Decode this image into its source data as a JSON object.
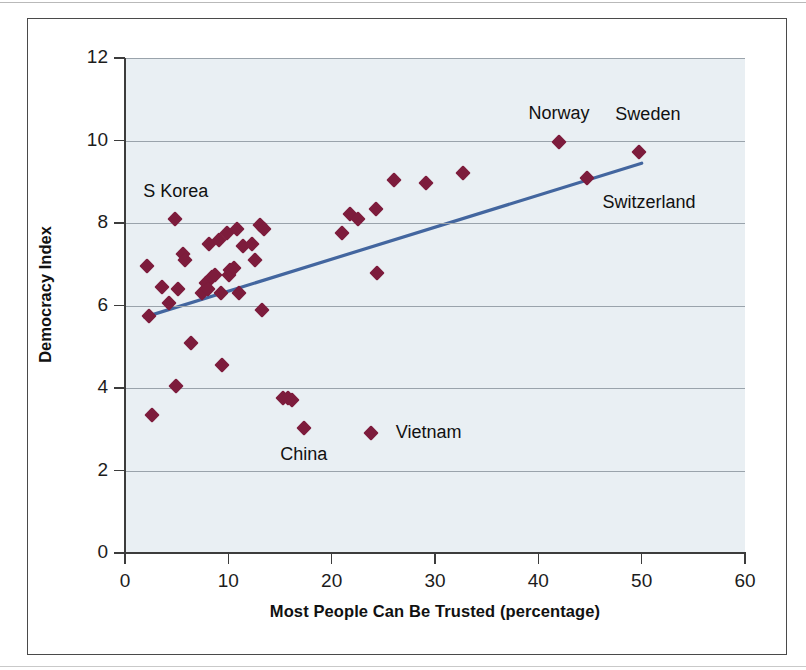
{
  "figure": {
    "background_color": "#ffffff",
    "frame_color": "#4a4a4a",
    "plot_background_color": "#e9eff3",
    "gridline_color": "#9aa3ab",
    "marker_color": "#7d1c3c",
    "trendline_color": "#43669f"
  },
  "chart_data": {
    "type": "scatter",
    "title": "",
    "xlabel": "Most People Can Be Trusted (percentage)",
    "ylabel": "Democracy Index",
    "xlim": [
      0,
      60
    ],
    "ylim": [
      0,
      12
    ],
    "xticks": [
      0,
      10,
      20,
      30,
      40,
      50,
      60
    ],
    "yticks": [
      0,
      2,
      4,
      6,
      8,
      10,
      12
    ],
    "xtick_labels": [
      "0",
      "10",
      "20",
      "30",
      "40",
      "50",
      "60"
    ],
    "ytick_labels": [
      "0",
      "2",
      "4",
      "6",
      "8",
      "10",
      "12"
    ],
    "grid": "horizontal",
    "legend": "none",
    "points": [
      {
        "x": 2.1,
        "y": 6.95,
        "label": ""
      },
      {
        "x": 2.3,
        "y": 5.75,
        "label": ""
      },
      {
        "x": 2.6,
        "y": 3.35,
        "label": ""
      },
      {
        "x": 3.6,
        "y": 6.45,
        "label": ""
      },
      {
        "x": 4.3,
        "y": 6.05,
        "label": ""
      },
      {
        "x": 4.8,
        "y": 8.1,
        "label": "S Korea"
      },
      {
        "x": 4.9,
        "y": 4.05,
        "label": ""
      },
      {
        "x": 5.1,
        "y": 6.4,
        "label": ""
      },
      {
        "x": 5.6,
        "y": 7.25,
        "label": ""
      },
      {
        "x": 5.8,
        "y": 7.1,
        "label": ""
      },
      {
        "x": 6.4,
        "y": 5.1,
        "label": ""
      },
      {
        "x": 7.4,
        "y": 6.3,
        "label": ""
      },
      {
        "x": 7.8,
        "y": 6.55,
        "label": ""
      },
      {
        "x": 8.0,
        "y": 6.4,
        "label": ""
      },
      {
        "x": 8.1,
        "y": 7.5,
        "label": ""
      },
      {
        "x": 8.4,
        "y": 6.7,
        "label": ""
      },
      {
        "x": 8.7,
        "y": 6.75,
        "label": ""
      },
      {
        "x": 9.1,
        "y": 7.6,
        "label": ""
      },
      {
        "x": 9.3,
        "y": 6.3,
        "label": ""
      },
      {
        "x": 9.4,
        "y": 4.55,
        "label": ""
      },
      {
        "x": 9.9,
        "y": 7.75,
        "label": ""
      },
      {
        "x": 10.1,
        "y": 6.75,
        "label": ""
      },
      {
        "x": 10.2,
        "y": 6.85,
        "label": ""
      },
      {
        "x": 10.5,
        "y": 6.9,
        "label": ""
      },
      {
        "x": 10.8,
        "y": 7.85,
        "label": ""
      },
      {
        "x": 11.0,
        "y": 6.3,
        "label": ""
      },
      {
        "x": 11.4,
        "y": 7.45,
        "label": ""
      },
      {
        "x": 12.3,
        "y": 7.5,
        "label": ""
      },
      {
        "x": 12.6,
        "y": 7.1,
        "label": ""
      },
      {
        "x": 13.1,
        "y": 7.95,
        "label": ""
      },
      {
        "x": 13.4,
        "y": 7.85,
        "label": ""
      },
      {
        "x": 13.3,
        "y": 5.9,
        "label": ""
      },
      {
        "x": 15.3,
        "y": 3.75,
        "label": ""
      },
      {
        "x": 15.8,
        "y": 3.75,
        "label": ""
      },
      {
        "x": 16.2,
        "y": 3.72,
        "label": ""
      },
      {
        "x": 17.3,
        "y": 3.03,
        "label": "China"
      },
      {
        "x": 21.0,
        "y": 7.75,
        "label": ""
      },
      {
        "x": 21.8,
        "y": 8.22,
        "label": ""
      },
      {
        "x": 22.5,
        "y": 8.1,
        "label": ""
      },
      {
        "x": 23.8,
        "y": 2.9,
        "label": "Vietnam"
      },
      {
        "x": 24.3,
        "y": 8.35,
        "label": ""
      },
      {
        "x": 24.4,
        "y": 6.78,
        "label": ""
      },
      {
        "x": 26.0,
        "y": 9.05,
        "label": ""
      },
      {
        "x": 29.1,
        "y": 8.98,
        "label": ""
      },
      {
        "x": 32.7,
        "y": 9.22,
        "label": ""
      },
      {
        "x": 42.0,
        "y": 9.97,
        "label": "Norway"
      },
      {
        "x": 44.7,
        "y": 9.08,
        "label": "Switzerland"
      },
      {
        "x": 49.7,
        "y": 9.72,
        "label": "Sweden"
      }
    ],
    "trendline": {
      "x0": 1.9,
      "y0": 5.72,
      "x1": 50.0,
      "y1": 9.45,
      "color": "#43669f"
    },
    "annotations": [
      {
        "text": "S Korea",
        "x": 4.9,
        "y": 8.75,
        "anchor": "center"
      },
      {
        "text": "China",
        "x": 17.3,
        "y": 2.38,
        "anchor": "center"
      },
      {
        "text": "Vietnam",
        "x": 26.2,
        "y": 2.92,
        "anchor": "left"
      },
      {
        "text": "Norway",
        "x": 42.0,
        "y": 10.65,
        "anchor": "center"
      },
      {
        "text": "Sweden",
        "x": 50.6,
        "y": 10.62,
        "anchor": "center"
      },
      {
        "text": "Switzerland",
        "x": 46.2,
        "y": 8.48,
        "anchor": "left"
      }
    ]
  }
}
